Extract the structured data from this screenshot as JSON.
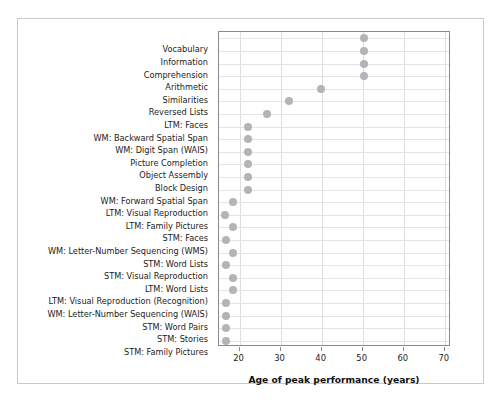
{
  "chart_data": {
    "type": "scatter",
    "title": "",
    "subtitle": "",
    "xlabel": "Age of peak performance (years)",
    "ylabel": "",
    "xlim": [
      15,
      71.5
    ],
    "ylim_categories_top_to_bottom": true,
    "grid": true,
    "legend": null,
    "point_color": "#b3b3b8",
    "categories": [
      "Vocabulary",
      "Information",
      "Comprehension",
      "Arithmetic",
      "Similarities",
      "Reversed Lists",
      "LTM: Faces",
      "WM: Backward Spatial Span",
      "WM: Digit Span (WAIS)",
      "Picture Completion",
      "Object Assembly",
      "Block Design",
      "WM: Forward Spatial Span",
      "LTM: Visual Reproduction",
      "LTM: Family Pictures",
      "STM: Faces",
      "WM: Letter-Number Sequencing (WMS)",
      "STM: Word Lists",
      "STM: Visual Reproduction",
      "LTM: Word Lists",
      "LTM: Visual Reproduction (Recognition)",
      "WM: Letter-Number Sequencing (WAIS)",
      "STM: Word Pairs",
      "STM: Stories",
      "STM: Family Pictures"
    ],
    "values": [
      50.2,
      50.2,
      50.2,
      50.2,
      39.8,
      32.0,
      26.8,
      22.0,
      22.0,
      22.0,
      22.0,
      22.0,
      22.0,
      18.4,
      16.4,
      18.4,
      16.6,
      18.4,
      16.6,
      18.4,
      18.4,
      16.6,
      16.8,
      16.8,
      16.8
    ],
    "xticks": [
      20,
      30,
      40,
      50,
      60,
      70
    ],
    "xticklabels": [
      "20",
      "30",
      "40",
      "50",
      "60",
      "70"
    ]
  }
}
